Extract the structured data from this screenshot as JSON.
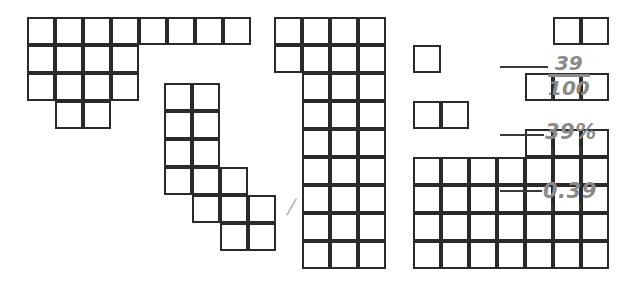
{
  "page": {
    "background_color": "#ffffff",
    "grid_line_color": "#2a2a2a",
    "annotation_color": "#8a8a8a",
    "width": 621,
    "height": 286
  },
  "shapes": [
    {
      "name": "shape-top-left",
      "origin_x": 27,
      "origin_y": 17,
      "cell_size": 28,
      "rows": [
        {
          "start_col": 0,
          "count": 8
        },
        {
          "start_col": 0,
          "count": 4
        },
        {
          "start_col": 0,
          "count": 4
        },
        {
          "start_col": 1,
          "count": 2
        }
      ],
      "total_cells": 18
    },
    {
      "name": "shape-middle",
      "origin_x": 164,
      "origin_y": 83,
      "cell_size": 28,
      "rows": [
        {
          "start_col": 0,
          "count": 2
        },
        {
          "start_col": 0,
          "count": 2
        },
        {
          "start_col": 0,
          "count": 2
        },
        {
          "start_col": 0,
          "count": 3
        },
        {
          "start_col": 1,
          "count": 3
        },
        {
          "start_col": 2,
          "count": 2
        }
      ],
      "total_cells": 14
    },
    {
      "name": "shape-tall-column",
      "origin_x": 274,
      "origin_y": 17,
      "cell_size": 28,
      "rows": [
        {
          "start_col": 0,
          "count": 4
        },
        {
          "start_col": 0,
          "count": 4
        },
        {
          "start_col": 1,
          "count": 3
        },
        {
          "start_col": 1,
          "count": 3
        },
        {
          "start_col": 1,
          "count": 3
        },
        {
          "start_col": 1,
          "count": 3
        },
        {
          "start_col": 1,
          "count": 3
        },
        {
          "start_col": 1,
          "count": 3
        },
        {
          "start_col": 1,
          "count": 3
        }
      ],
      "total_cells": 29
    },
    {
      "name": "shape-annotated",
      "origin_x": 413,
      "origin_y": 17,
      "cell_size": 28,
      "rows": [
        {
          "start_col": 5,
          "count": 2
        },
        {
          "start_col": 0,
          "count": 1
        },
        {
          "start_col": 4,
          "count": 3
        },
        {
          "start_col": 0,
          "count": 2
        },
        {
          "start_col": 4,
          "count": 3
        },
        {
          "start_col": 0,
          "count": 7
        },
        {
          "start_col": 0,
          "count": 7
        },
        {
          "start_col": 0,
          "count": 7
        },
        {
          "start_col": 0,
          "count": 7
        }
      ],
      "total_cells": 39
    }
  ],
  "annotations": {
    "fraction": {
      "numerator": "39",
      "denominator": "100",
      "x": 548,
      "y": 53
    },
    "percent": {
      "text": "39%",
      "x": 545,
      "y": 122
    },
    "decimal": {
      "text": "0.39",
      "x": 543,
      "y": 181
    }
  },
  "stray_mark": {
    "glyph": "/",
    "x": 288,
    "y": 194
  }
}
